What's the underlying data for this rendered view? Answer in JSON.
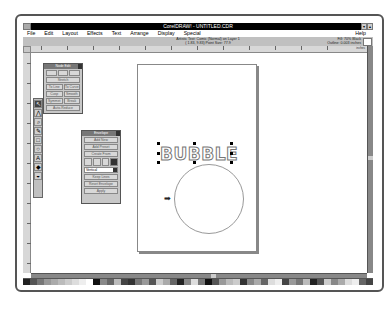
{
  "window": {
    "title": "CorelDRAW! - UNTITLED.CDR",
    "controls": [
      "▾",
      "▴"
    ]
  },
  "menubar": {
    "items": [
      "File",
      "Edit",
      "Layout",
      "Effects",
      "Text",
      "Arrange",
      "Display",
      "Special"
    ],
    "help": "Help"
  },
  "statusbar": {
    "line1": "Artistic Text: Comic (Normal) on Layer 1",
    "line2": "( 1.83, 9.83) Point Size: 77.9",
    "fill": "Fill: 70% Black",
    "outline": "Outline: 0.003 inches"
  },
  "ruler": {
    "units_label": "inches",
    "h_labels": [
      "0",
      "1",
      "2",
      "3",
      "4",
      "5",
      "6",
      "7",
      "8",
      "9",
      "10",
      "11",
      "12"
    ]
  },
  "toolbox": {
    "tools": [
      "pick-tool",
      "shape-tool",
      "zoom-tool",
      "pencil-tool",
      "rectangle-tool",
      "ellipse-tool",
      "text-tool",
      "outline-tool",
      "fill-tool"
    ]
  },
  "node_edit_rollup": {
    "title": "Node Edit",
    "buttons": [
      "To Line",
      "To Curve",
      "Cusp",
      "Smooth",
      "Symmet",
      "Break",
      "Join",
      "Auto-Reduce"
    ],
    "bottom_button": "Stretch"
  },
  "envelope_rollup": {
    "title": "Envelope",
    "buttons": [
      "Add New",
      "Add Preset",
      "Create From"
    ],
    "mode_select": "Vertical",
    "keep_lines": "Keep Lines",
    "reset_envelope": "Reset Envelope",
    "apply": "Apply"
  },
  "canvas": {
    "artistic_text": "BUBBLE"
  },
  "palette": {
    "colors": [
      "#222222",
      "#555555",
      "#777777",
      "#999999",
      "#aaaaaa",
      "#bbbbbb",
      "#cccccc",
      "#dddddd",
      "#eeeeee",
      "#ffffff",
      "#111111",
      "#888888",
      "#666666",
      "#bbbbbb",
      "#444444",
      "#333333",
      "#777777",
      "#999999",
      "#555555",
      "#cccccc",
      "#aaaaaa",
      "#666666",
      "#222222",
      "#888888",
      "#dddddd",
      "#777777",
      "#111111",
      "#555555",
      "#999999",
      "#bbbbbb",
      "#cccccc",
      "#333333",
      "#888888",
      "#aaaaaa",
      "#666666",
      "#dddddd",
      "#eeeeee",
      "#444444",
      "#999999",
      "#777777",
      "#bbbbbb",
      "#222222",
      "#555555",
      "#cccccc",
      "#888888",
      "#aaaaaa",
      "#dddddd",
      "#eeeeee",
      "#666666",
      "#444444"
    ]
  }
}
